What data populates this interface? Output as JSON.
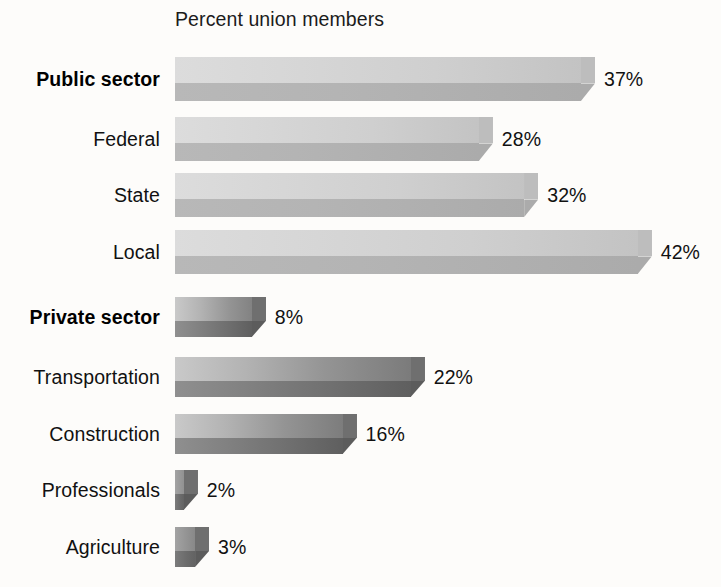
{
  "chart_data": {
    "type": "bar",
    "orientation": "horizontal",
    "title": "Percent union members",
    "xlabel": "",
    "ylabel": "",
    "grid": false,
    "legend": null,
    "xlim": [
      0,
      42
    ],
    "unit": "%",
    "categories": [
      "Public sector",
      "Federal",
      "State",
      "Local",
      "Private sector",
      "Transportation",
      "Construction",
      "Professionals",
      "Agriculture"
    ],
    "values": [
      37,
      28,
      32,
      42,
      8,
      22,
      16,
      2,
      3
    ],
    "value_labels": [
      "37%",
      "28%",
      "32%",
      "42%",
      "8%",
      "22%",
      "16%",
      "2%",
      "3%"
    ],
    "groups": [
      {
        "name": "Public sector",
        "bold_header": true,
        "categories": [
          "Public sector",
          "Federal",
          "State",
          "Local"
        ],
        "values": [
          37,
          28,
          32,
          42
        ]
      },
      {
        "name": "Private sector",
        "bold_header": true,
        "categories": [
          "Private sector",
          "Transportation",
          "Construction",
          "Professionals",
          "Agriculture"
        ],
        "values": [
          8,
          22,
          16,
          2,
          3
        ]
      }
    ]
  },
  "bars": [
    {
      "label": "Public sector",
      "value": 37,
      "value_label": "37%",
      "bold": true,
      "palette": "public",
      "top": 57,
      "height": 44
    },
    {
      "label": "Federal",
      "value": 28,
      "value_label": "28%",
      "bold": false,
      "palette": "public",
      "top": 117,
      "height": 44
    },
    {
      "label": "State",
      "value": 32,
      "value_label": "32%",
      "bold": false,
      "palette": "public",
      "top": 173,
      "height": 44
    },
    {
      "label": "Local",
      "value": 42,
      "value_label": "42%",
      "bold": false,
      "palette": "public",
      "top": 230,
      "height": 44
    },
    {
      "label": "Private sector",
      "value": 8,
      "value_label": "8%",
      "bold": true,
      "palette": "private",
      "top": 297,
      "height": 40
    },
    {
      "label": "Transportation",
      "value": 22,
      "value_label": "22%",
      "bold": false,
      "palette": "private",
      "top": 357,
      "height": 40
    },
    {
      "label": "Construction",
      "value": 16,
      "value_label": "16%",
      "bold": false,
      "palette": "private",
      "top": 414,
      "height": 40
    },
    {
      "label": "Professionals",
      "value": 2,
      "value_label": "2%",
      "bold": false,
      "palette": "private",
      "top": 470,
      "height": 40
    },
    {
      "label": "Agriculture",
      "value": 3,
      "value_label": "3%",
      "bold": false,
      "palette": "private",
      "top": 527,
      "height": 40
    }
  ],
  "geometry": {
    "bar_origin_x": 175,
    "px_per_percent": 11.35,
    "bevel_width": 14,
    "label_right_x": 160,
    "value_gap": 9
  },
  "colors": {
    "background": "#fdfcfa",
    "text": "#111111",
    "public_light": "#dcdcdc",
    "public_dark": "#ababab",
    "private_light": "#c9c9c9",
    "private_dark": "#5f5f5f"
  }
}
